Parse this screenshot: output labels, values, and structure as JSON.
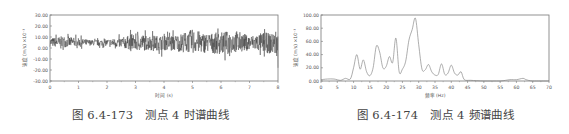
{
  "figures": [
    {
      "caption_number": "图 6.4-173",
      "caption_text": "测点 4 时谱曲线"
    },
    {
      "caption_number": "图 6.4-174",
      "caption_text": "测点 4 频谱曲线"
    }
  ],
  "chart_data": [
    {
      "type": "line",
      "title": "测点 4 时谱曲线",
      "xlabel": "时间 (s)",
      "ylabel": "速度 (m/s) ×10⁻³",
      "xlim": [
        0,
        8
      ],
      "ylim": [
        -30,
        30
      ],
      "x_ticks": [
        "0",
        "1",
        "2",
        "3",
        "4",
        "5",
        "6",
        "7",
        "8"
      ],
      "y_ticks": [
        "30.00",
        "20.00",
        "10.00",
        "0.00",
        "-10.00",
        "-20.00",
        "-30.00"
      ],
      "grid": false,
      "description": "Dense vibration velocity time history around ~5 (×10⁻³) with noise; amplitude roughly -15 to +27, largest spikes near t≈5.1 and t≈6.7",
      "x": [
        0,
        0.5,
        1,
        1.5,
        2,
        2.5,
        3,
        3.5,
        4,
        4.5,
        5,
        5.5,
        6,
        6.5,
        7,
        7.5,
        8
      ],
      "envelope_max": [
        12,
        16,
        12,
        9,
        10,
        13,
        20,
        17,
        16,
        18,
        27,
        20,
        22,
        26,
        16,
        22,
        18
      ],
      "envelope_min": [
        -2,
        -3,
        -1,
        0,
        -1,
        -4,
        -9,
        -8,
        -8,
        -10,
        -13,
        -12,
        -15,
        -12,
        -8,
        -11,
        -18
      ]
    },
    {
      "type": "line",
      "title": "测点 4 频谱曲线",
      "xlabel": "频率 (Hz)",
      "ylabel": "速度 (m/s) ×10⁻³",
      "xlim": [
        0,
        70
      ],
      "ylim": [
        0,
        100
      ],
      "x_ticks": [
        "0",
        "5",
        "10",
        "15",
        "20",
        "25",
        "30",
        "35",
        "40",
        "45",
        "50",
        "55",
        "60",
        "65",
        "70"
      ],
      "y_ticks": [
        "100.00",
        "80.00",
        "60.00",
        "40.00",
        "20.00",
        "0.00"
      ],
      "grid": false,
      "x": [
        0,
        2,
        4,
        6,
        7.5,
        9,
        10,
        11,
        12,
        13,
        14,
        15,
        16,
        17,
        18,
        19,
        20,
        21,
        22,
        23,
        24,
        25,
        26,
        27,
        28,
        29,
        30,
        31,
        32,
        33,
        34,
        35,
        36,
        37,
        38,
        39,
        40,
        41,
        42,
        43,
        44,
        46,
        50,
        55,
        58,
        60,
        62,
        63,
        65,
        70
      ],
      "values": [
        2,
        3,
        3,
        1,
        4,
        3,
        20,
        40,
        18,
        32,
        14,
        8,
        20,
        53,
        44,
        20,
        22,
        37,
        28,
        65,
        14,
        18,
        30,
        62,
        78,
        95,
        55,
        18,
        17,
        25,
        14,
        9,
        10,
        26,
        10,
        12,
        24,
        12,
        9,
        14,
        2,
        1,
        0,
        0,
        2,
        2,
        4,
        2,
        0,
        0
      ]
    }
  ]
}
